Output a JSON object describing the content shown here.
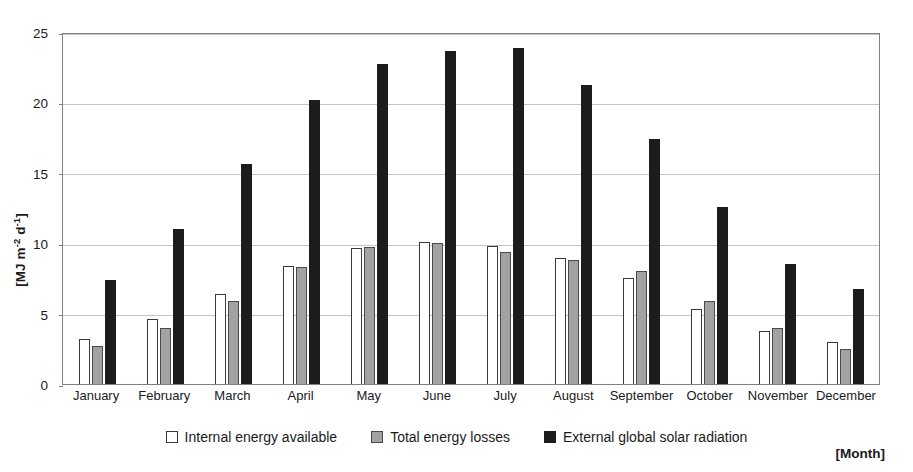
{
  "chart_data": {
    "type": "bar",
    "title": "",
    "subtitle": "",
    "xlabel": "[Month]",
    "ylabel": "[MJ m-2 d-1]",
    "ylabel_parts": {
      "prefix": "[MJ m",
      "sup1": "-2",
      "mid": " d",
      "sup2": "-1",
      "suffix": "]"
    },
    "categories": [
      "January",
      "February",
      "March",
      "April",
      "May",
      "June",
      "July",
      "August",
      "September",
      "October",
      "November",
      "December"
    ],
    "series": [
      {
        "name": "Internal energy available",
        "color": "#ffffff",
        "border": "#3a3a3a",
        "values": [
          3.2,
          4.6,
          6.4,
          8.4,
          9.65,
          10.1,
          9.8,
          8.95,
          7.5,
          5.35,
          3.75,
          3.0
        ]
      },
      {
        "name": "Total energy losses",
        "color": "#a2a2a2",
        "border": "#4a4a4a",
        "values": [
          2.7,
          4.0,
          5.9,
          8.3,
          9.7,
          10.0,
          9.4,
          8.8,
          8.0,
          5.9,
          3.95,
          2.5
        ]
      },
      {
        "name": "External global solar radiation",
        "color": "#1c1c1c",
        "border": "#1c1c1c",
        "values": [
          7.4,
          11.0,
          15.6,
          20.2,
          22.7,
          23.65,
          23.85,
          21.25,
          17.4,
          12.6,
          8.5,
          6.75
        ]
      }
    ],
    "ylim": [
      0,
      25
    ],
    "yticks": [
      0,
      5,
      10,
      15,
      20,
      25
    ],
    "grid": true,
    "legend_position": "bottom"
  },
  "legend": {
    "items": [
      {
        "label": "Internal energy available"
      },
      {
        "label": "Total energy losses"
      },
      {
        "label": "External global solar radiation"
      }
    ]
  },
  "axis": {
    "x_title": "[Month]"
  }
}
